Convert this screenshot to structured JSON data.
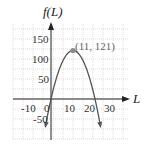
{
  "chart_data": {
    "type": "line",
    "title": "",
    "xlabel": "L",
    "ylabel": "f(L)",
    "function": "f(L) = -L^2 + 22L",
    "xlim": [
      -19,
      38
    ],
    "ylim": [
      -65,
      175
    ],
    "grid": true,
    "x_ticks": [
      -10,
      0,
      10,
      20,
      30
    ],
    "x_tick_labels": [
      "-10",
      "0",
      "10",
      "20",
      "30"
    ],
    "y_ticks": [
      -50,
      50,
      100,
      150
    ],
    "y_tick_labels": [
      "-50",
      "50",
      "100",
      "150"
    ],
    "series": [
      {
        "name": "f(L)",
        "x": [
          -2.8,
          0,
          2,
          4,
          6,
          8,
          10,
          11,
          12,
          14,
          16,
          18,
          20,
          22,
          24,
          24.8
        ],
        "values": [
          -69.4,
          0,
          40,
          72,
          96,
          112,
          120,
          121,
          120,
          112,
          96,
          72,
          40,
          0,
          -48,
          -69.4
        ],
        "color": "#555555"
      }
    ],
    "annotations": [
      {
        "text": "(11, 121)",
        "x": 11,
        "y": 121,
        "marker": "filled-circle",
        "color": "#888888"
      }
    ],
    "legend": null
  },
  "labels": {
    "y_axis_title": "f(L)",
    "x_axis_title": "L",
    "vertex_label": "(11, 121)",
    "x_ticks": [
      "-10",
      "0",
      "10",
      "20",
      "30"
    ],
    "y_ticks": [
      "150",
      "100",
      "50",
      "-50"
    ]
  },
  "colors": {
    "grid": "#c8c8c8",
    "axis": "#222222",
    "curve": "#555555",
    "vertex": "#8a8a8a"
  }
}
